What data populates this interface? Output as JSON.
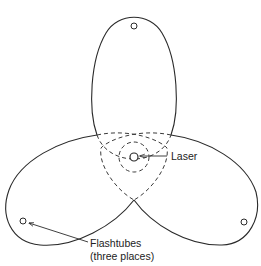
{
  "diagram": {
    "type": "three-lobed elliptical pump cavity",
    "labels": {
      "laser": "Laser",
      "flashtubes_line1": "Flashtubes",
      "flashtubes_line2": "(three places)"
    },
    "components": {
      "laser_rod": {
        "cx": 134,
        "cy": 157,
        "r": 4
      },
      "flashtubes": [
        {
          "position": "top",
          "cx": 134,
          "cy": 26,
          "r": 3
        },
        {
          "position": "bottom-left",
          "cx": 23,
          "cy": 221,
          "r": 3
        },
        {
          "position": "bottom-right",
          "cx": 244,
          "cy": 222,
          "r": 3
        }
      ],
      "ellipse_count": 3
    },
    "colors": {
      "line": "#2a2a2a",
      "background": "#ffffff"
    }
  }
}
